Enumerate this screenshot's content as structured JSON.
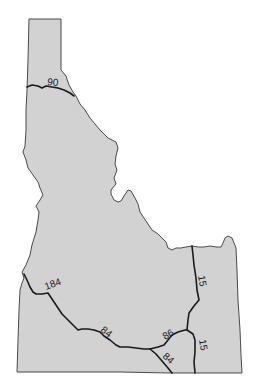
{
  "map": {
    "region": "Idaho",
    "fill_color": "#d2d2d2",
    "outline_color": "#4a4a4a",
    "highway_color": "#1a1a1a",
    "highways": [
      {
        "id": "i90",
        "label": "90"
      },
      {
        "id": "i184",
        "label": "184"
      },
      {
        "id": "i84-west",
        "label": "84"
      },
      {
        "id": "i86",
        "label": "86"
      },
      {
        "id": "i84-south",
        "label": "84"
      },
      {
        "id": "i15-north",
        "label": "15"
      },
      {
        "id": "i15-south",
        "label": "15"
      }
    ]
  }
}
